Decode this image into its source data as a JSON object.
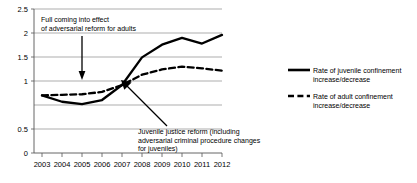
{
  "chart_data": {
    "type": "line",
    "title": "",
    "xlabel": "",
    "ylabel": "",
    "x": [
      2003,
      2004,
      2005,
      2006,
      2007,
      2008,
      2009,
      2010,
      2011,
      2012
    ],
    "categories": [
      "2003",
      "2004",
      "2005",
      "2006",
      "2007",
      "2008",
      "2009",
      "2010",
      "2011",
      "2012"
    ],
    "xlim": [
      2003,
      2012
    ],
    "ylim": [
      0,
      2.5
    ],
    "yticks": [
      0,
      0.5,
      1,
      1.5,
      2,
      2.5
    ],
    "ytick_labels": [
      "0",
      "0.5",
      "1",
      "1.5",
      "2",
      "2.5"
    ],
    "grid": true,
    "legend_position": "right",
    "series": [
      {
        "name": "Rate of juvenile confinement increase/decrease",
        "style": "solid",
        "color": "#000000",
        "values": [
          1.0,
          0.89,
          0.85,
          0.92,
          1.18,
          1.66,
          1.88,
          2.0,
          1.9,
          2.05
        ]
      },
      {
        "name": "Rate of adult confinement increase/decrease",
        "style": "dashed",
        "color": "#000000",
        "values": [
          1.0,
          1.01,
          1.02,
          1.06,
          1.18,
          1.36,
          1.45,
          1.5,
          1.47,
          1.43
        ]
      }
    ],
    "annotations": [
      {
        "id": "adult-reform",
        "lines": [
          "Full coming into effect",
          "of adversarial reform for adults"
        ],
        "text": "Full coming into effect of adversarial reform for adults",
        "arrow_target_x": 2005,
        "arrow_target_y": 1.02
      },
      {
        "id": "juvenile-reform",
        "lines": [
          "Juvenile justice reform (including",
          "adversarial criminal procedure changes",
          "for juveniles)"
        ],
        "text": "Juvenile justice reform (including adversarial criminal procedure changes for juveniles)",
        "arrow_target_x": 2006.6,
        "arrow_target_y": 1.16
      }
    ]
  },
  "ytick_labels": {
    "t0": "0",
    "t1": "0.5",
    "t2": "1",
    "t3": "1.5",
    "t4": "2",
    "t5": "2.5"
  },
  "xtick_labels": {
    "x0": "2003",
    "x1": "2004",
    "x2": "2005",
    "x3": "2006",
    "x4": "2007",
    "x5": "2008",
    "x6": "2009",
    "x7": "2010",
    "x8": "2011",
    "x9": "2012"
  },
  "annotation_adult": {
    "line1": "Full coming into effect",
    "line2": "of adversarial reform for adults"
  },
  "annotation_juvenile": {
    "line1": "Juvenile justice reform (including",
    "line2": "adversarial criminal procedure changes",
    "line3": "for juveniles)"
  },
  "legend": {
    "series1_line1": "Rate of juvenile confinement",
    "series1_line2": "increase/decrease",
    "series2_line1": "Rate of adult confinement",
    "series2_line2": "increase/decrease"
  },
  "colors": {
    "line": "#000000",
    "grid": "#7a7a7a",
    "background": "#ffffff"
  }
}
